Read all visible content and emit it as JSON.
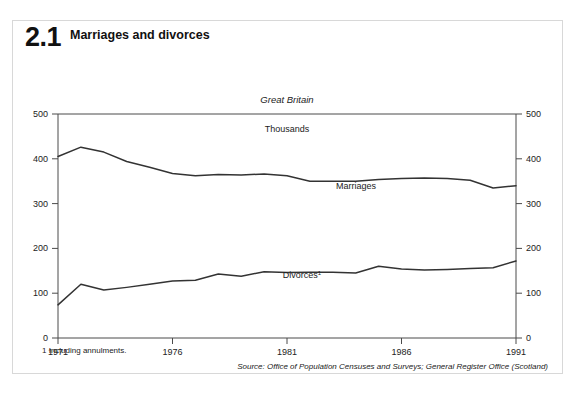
{
  "figure": {
    "number": "2.1",
    "title": "Marriages and divorces"
  },
  "footnote": "1  Including annulments.",
  "source": "Source: Office of Population Censuses and Surveys; General Register Office (Scotland)",
  "labels": {
    "region": "Great Britain",
    "units": "Thousands",
    "marriages": "Marriages",
    "divorces": "Divorces",
    "divorces_footnote_marker": "1"
  },
  "axis": {
    "y_ticks": [
      "0",
      "100",
      "200",
      "300",
      "400",
      "500"
    ],
    "x_ticks": [
      "1971",
      "1976",
      "1981",
      "1986",
      "1991"
    ]
  },
  "colors": {
    "line": "#333333",
    "axis": "#4a4a4a",
    "panel_border": "#d8d8d8",
    "background": "#ffffff"
  },
  "chart_data": {
    "type": "line",
    "title": "Marriages and divorces",
    "subtitle": "Great Britain",
    "xlabel": "",
    "ylabel": "Thousands",
    "ylim": [
      0,
      500
    ],
    "xlim": [
      1971,
      1991
    ],
    "grid": false,
    "legend": "inline-annotations",
    "x": [
      1971,
      1972,
      1973,
      1974,
      1975,
      1976,
      1977,
      1978,
      1979,
      1980,
      1981,
      1982,
      1983,
      1984,
      1985,
      1986,
      1987,
      1988,
      1989,
      1990,
      1991
    ],
    "series": [
      {
        "name": "Marriages",
        "values": [
          405,
          426,
          415,
          394,
          381,
          367,
          362,
          365,
          364,
          366,
          362,
          350,
          350,
          350,
          354,
          356,
          357,
          356,
          352,
          335,
          340
        ]
      },
      {
        "name": "Divorces",
        "values": [
          74,
          120,
          107,
          113,
          120,
          127,
          129,
          143,
          138,
          148,
          146,
          147,
          147,
          145,
          160,
          154,
          152,
          153,
          155,
          157,
          172
        ]
      }
    ],
    "annotations": [
      {
        "text": "Marriages",
        "x": 1984,
        "y": 385
      },
      {
        "text": "Divorces1",
        "x": 1979,
        "y": 182
      }
    ]
  }
}
